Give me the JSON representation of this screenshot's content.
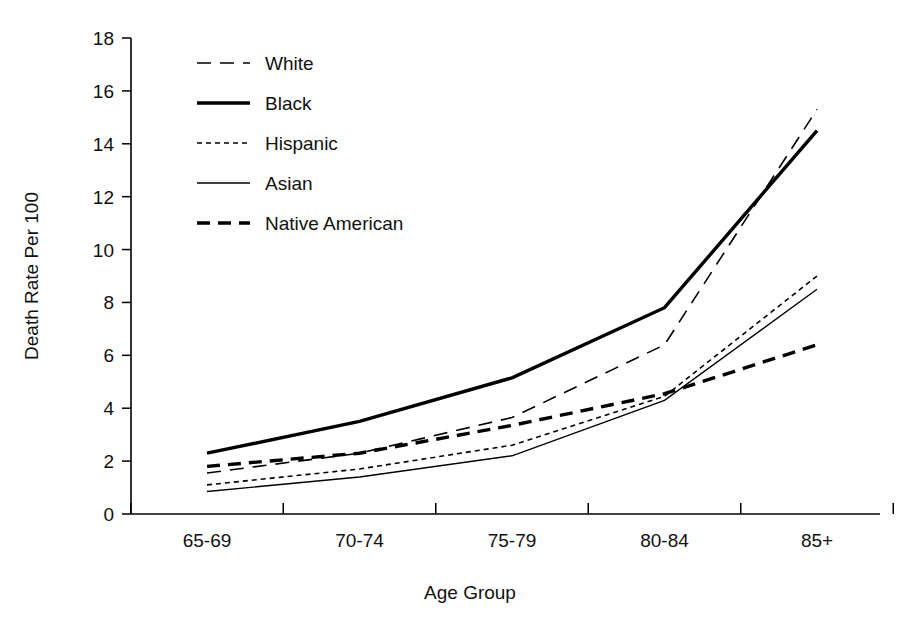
{
  "chart_data": {
    "type": "line",
    "title": "",
    "xlabel": "Age Group",
    "ylabel": "Death Rate Per 100",
    "categories": [
      "65-69",
      "70-74",
      "75-79",
      "80-84",
      "85+"
    ],
    "ylim": [
      0,
      18
    ],
    "ytick_values": [
      0,
      2,
      4,
      6,
      8,
      10,
      12,
      14,
      16,
      18
    ],
    "ytick_labels": [
      "0",
      "2",
      "4",
      "6",
      "8",
      "10",
      "12",
      "14",
      "16",
      "18"
    ],
    "grid": false,
    "legend_position": "upper-left-inside",
    "series": [
      {
        "name": "White",
        "style": "long-dash",
        "stroke_width": 1.6,
        "dash": "14,9",
        "color": "#000000",
        "values": [
          1.55,
          2.3,
          3.65,
          6.4,
          15.3
        ]
      },
      {
        "name": "Black",
        "style": "thick-solid",
        "stroke_width": 3.4,
        "dash": "",
        "color": "#000000",
        "values": [
          2.3,
          3.5,
          5.15,
          7.8,
          14.5
        ]
      },
      {
        "name": "Hispanic",
        "style": "short-dash",
        "stroke_width": 1.6,
        "dash": "5,4",
        "color": "#000000",
        "values": [
          1.1,
          1.7,
          2.6,
          4.45,
          9.0
        ]
      },
      {
        "name": "Asian",
        "style": "thin-solid",
        "stroke_width": 1.4,
        "dash": "",
        "color": "#000000",
        "values": [
          0.85,
          1.4,
          2.2,
          4.3,
          8.5
        ]
      },
      {
        "name": "Native American",
        "style": "thick-dash",
        "stroke_width": 3.4,
        "dash": "13,8",
        "color": "#000000",
        "values": [
          1.8,
          2.3,
          3.35,
          4.55,
          6.4
        ]
      }
    ]
  },
  "axes": {
    "y_axis_title": "Death Rate Per 100",
    "x_axis_title": "Age Group"
  },
  "legend": {
    "items": [
      {
        "label": "White"
      },
      {
        "label": "Black"
      },
      {
        "label": "Hispanic"
      },
      {
        "label": "Asian"
      },
      {
        "label": "Native American"
      }
    ]
  }
}
